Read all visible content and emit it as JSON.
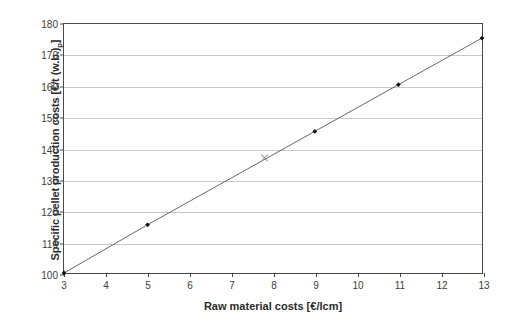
{
  "chart_data": {
    "type": "line",
    "title": "",
    "xlabel": "Raw material costs [€/lcm]",
    "ylabel_text": "Specific pellet production costs [€/t (w.b.)",
    "ylabel_subscript": "p",
    "ylabel_tail": "]",
    "xlim": [
      3,
      13
    ],
    "ylim": [
      100,
      180
    ],
    "xticks": [
      3,
      4,
      5,
      6,
      7,
      8,
      9,
      10,
      11,
      12,
      13
    ],
    "yticks": [
      100,
      110,
      120,
      130,
      140,
      150,
      160,
      170,
      180
    ],
    "grid": "horizontal",
    "legend": "none",
    "series": [
      {
        "name": "Specific pellet production costs",
        "marker": "filled-diamond",
        "line_color": "#555555",
        "marker_color": "#111111",
        "x": [
          3,
          5,
          9,
          11,
          13
        ],
        "y": [
          100.0,
          115.5,
          145.5,
          160.5,
          175.5
        ]
      },
      {
        "name": "Reference case",
        "marker": "cross",
        "marker_color": "#9a9a9a",
        "x": [
          7.8
        ],
        "y": [
          137.0
        ]
      }
    ]
  },
  "axes": {
    "frame_color": "#4a4a4a",
    "grid_color": "#c9c9c9",
    "tick_label_color": "#3d3d3d",
    "background": "#ffffff"
  }
}
